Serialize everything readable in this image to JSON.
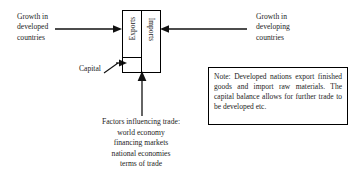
{
  "diagram": {
    "background_color": "#ffffff",
    "line_color": "#000000",
    "text_color": "#1c1c1c"
  },
  "labels": {
    "growth_developed": "Growth in\ndeveloped\ncountries",
    "growth_developing": "Growth in\ndeveloping\ncountries",
    "capital": "Capital",
    "factors": "Factors influencing trade:\nworld economy\nfinancing markets\nnational economies\nterms of trade"
  },
  "trade_box": {
    "exports_label": "Exports",
    "imports_label": "Imports"
  },
  "note": {
    "text": "Note: Developed nations export finished goods and import raw materials. The capital balance allows for further trade to be developed etc."
  },
  "arrows": {
    "left_inbound": "arrow pointing right into exports column",
    "right_inbound": "arrow pointing left into imports column",
    "bottom_inbound": "arrow pointing up into trade box",
    "capital_pointer": "leader line pointing to capital cell"
  }
}
